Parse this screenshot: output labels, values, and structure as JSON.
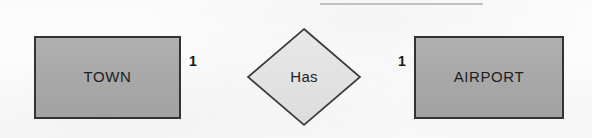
{
  "diagram": {
    "type": "entity-relationship-diagram",
    "background_color": "#fcfcfc",
    "entities": [
      {
        "id": "town",
        "label": "TOWN",
        "shape": "rectangle",
        "fill_color": "#a9a9a9",
        "border_color": "#333333",
        "x": 35,
        "y": 37,
        "width": 145,
        "height": 81
      },
      {
        "id": "airport",
        "label": "AIRPORT",
        "shape": "rectangle",
        "fill_color": "#a9a9a9",
        "border_color": "#333333",
        "x": 415,
        "y": 37,
        "width": 148,
        "height": 81
      }
    ],
    "relationships": [
      {
        "id": "has",
        "label": "Has",
        "shape": "diamond",
        "fill_color": "#e2e2e2",
        "border_color": "#3a3a3a",
        "center_x": 304,
        "center_y": 77,
        "half_width": 56,
        "half_height": 48
      }
    ],
    "connectors": [
      {
        "id": "town-has",
        "from": "town",
        "to": "has",
        "x1": 180,
        "y1": 77,
        "x2": 248,
        "y2": 77,
        "cardinality": "1",
        "cardinality_x": 193,
        "cardinality_y": 62,
        "line_color": "#2b2b2b"
      },
      {
        "id": "has-airport",
        "from": "has",
        "to": "airport",
        "x1": 360,
        "y1": 77,
        "x2": 415,
        "y2": 77,
        "cardinality": "1",
        "cardinality_x": 402,
        "cardinality_y": 62,
        "line_color": "#2b2b2b"
      }
    ],
    "artifacts": [
      {
        "id": "page-rule-fragment",
        "description": "faint horizontal rule clipped at the top edge of the scan",
        "x": 320,
        "y": 3,
        "width": 163,
        "height": 2,
        "color": "#b9b9b9"
      }
    ]
  }
}
